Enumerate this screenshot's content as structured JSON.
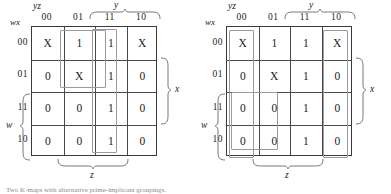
{
  "figure": {
    "caption": "Two K-maps with alternative prime-implicant groupings."
  },
  "maps": [
    {
      "id": "left",
      "col_header_label": "yz",
      "row_header_label": "wx",
      "col_labels": [
        "00",
        "01",
        "11",
        "10"
      ],
      "row_labels": [
        "00",
        "01",
        "11",
        "10"
      ],
      "variable_braces": {
        "y": "y",
        "x": "x",
        "w": "w",
        "z": "z"
      },
      "cells": [
        [
          "X",
          "1",
          "1",
          "X"
        ],
        [
          "0",
          "X",
          "1",
          "0"
        ],
        [
          "0",
          "0",
          "1",
          "0"
        ],
        [
          "0",
          "0",
          "1",
          "0"
        ]
      ],
      "groups": [
        {
          "name": "group-col11-full",
          "cols": [
            2,
            2
          ],
          "rows": [
            0,
            3
          ]
        },
        {
          "name": "group-rows00-01-cols01-11",
          "cols": [
            1,
            2
          ],
          "rows": [
            0,
            1
          ]
        }
      ]
    },
    {
      "id": "right",
      "col_header_label": "yz",
      "row_header_label": "wx",
      "col_labels": [
        "00",
        "01",
        "11",
        "10"
      ],
      "row_labels": [
        "00",
        "01",
        "11",
        "10"
      ],
      "variable_braces": {
        "y": "y",
        "x": "x",
        "w": "w",
        "z": "z"
      },
      "cells": [
        [
          "X",
          "1",
          "1",
          "X"
        ],
        [
          "0",
          "X",
          "1",
          "0"
        ],
        [
          "0",
          "0",
          "1",
          "0"
        ],
        [
          "0",
          "0",
          "1",
          "0"
        ]
      ],
      "groups": [
        {
          "name": "group-col00-wrap",
          "cols": [
            0,
            0
          ],
          "rows": [
            0,
            3
          ]
        },
        {
          "name": "group-rows11-10-cols00-01",
          "cols": [
            0,
            1
          ],
          "rows": [
            2,
            3
          ]
        },
        {
          "name": "group-col10-wrap",
          "cols": [
            3,
            3
          ],
          "rows": [
            0,
            3
          ]
        }
      ]
    }
  ]
}
